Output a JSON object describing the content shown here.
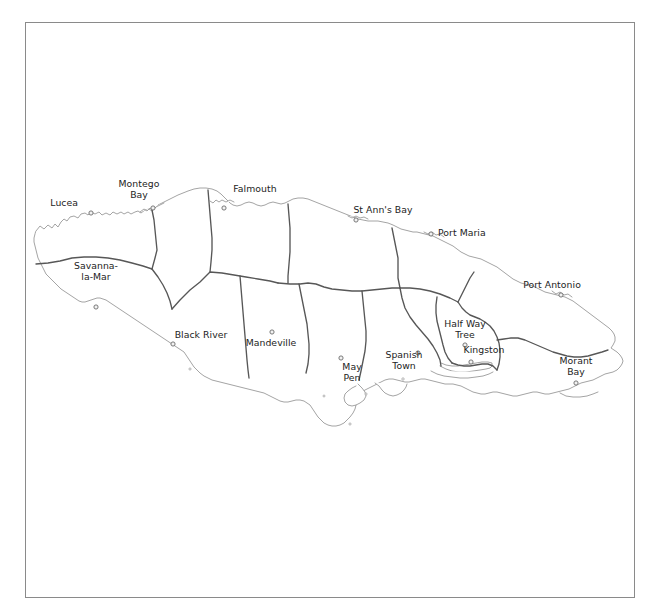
{
  "document": {
    "type": "map",
    "subject": "Jamaica parish map",
    "background_color": "#ffffff",
    "frame": {
      "name": "map-frame",
      "border_color": "#8a8a8a",
      "x": 25,
      "y": 22,
      "width": 610,
      "height": 576
    }
  },
  "map": {
    "coastline_color": "#8d8d8d",
    "parish_border_color": "#575757",
    "land_fill": "#ffffff",
    "label_color": "#232323",
    "marker_fill": "#f2f2f2",
    "marker_stroke": "#6b6b6b",
    "cities": [
      {
        "name": "Lucea",
        "label": "Lucea",
        "dot_x": 91,
        "dot_y": 213,
        "label_x": 78,
        "label_y": 198,
        "align": "r",
        "lines": [
          "Lucea"
        ]
      },
      {
        "name": "Montego Bay",
        "label": "Montego Bay",
        "dot_x": 153,
        "dot_y": 208,
        "label_x": 139,
        "label_y": 179,
        "align": "c",
        "lines": [
          "Montego",
          "Bay"
        ]
      },
      {
        "name": "Falmouth",
        "label": "Falmouth",
        "dot_x": 224,
        "dot_y": 208,
        "label_x": 255,
        "label_y": 184,
        "align": "c",
        "lines": [
          "Falmouth"
        ]
      },
      {
        "name": "St Ann's Bay",
        "label": "St Ann's Bay",
        "dot_x": 356,
        "dot_y": 220,
        "label_x": 383,
        "label_y": 205,
        "align": "c",
        "lines": [
          "St Ann's Bay"
        ]
      },
      {
        "name": "Port Maria",
        "label": "Port Maria",
        "dot_x": 431,
        "dot_y": 234,
        "label_x": 438,
        "label_y": 228,
        "align": "l",
        "lines": [
          "Port Maria"
        ]
      },
      {
        "name": "Port Antonio",
        "label": "Port Antonio",
        "dot_x": 561,
        "dot_y": 295,
        "label_x": 552,
        "label_y": 280,
        "align": "c",
        "lines": [
          "Port Antonio"
        ]
      },
      {
        "name": "Savanna-la-Mar",
        "label": "Savanna-la-Mar",
        "dot_x": 96,
        "dot_y": 307,
        "label_x": 96,
        "label_y": 261,
        "align": "c",
        "lines": [
          "Savanna-",
          "la-Mar"
        ]
      },
      {
        "name": "Black River",
        "label": "Black River",
        "dot_x": 173,
        "dot_y": 344,
        "label_x": 201,
        "label_y": 330,
        "align": "c",
        "lines": [
          "Black River"
        ]
      },
      {
        "name": "Mandeville",
        "label": "Mandeville",
        "dot_x": 272,
        "dot_y": 332,
        "label_x": 271,
        "label_y": 338,
        "align": "c",
        "lines": [
          "Mandeville"
        ]
      },
      {
        "name": "May Pen",
        "label": "May Pen",
        "dot_x": 341,
        "dot_y": 358,
        "label_x": 352,
        "label_y": 362,
        "align": "c",
        "lines": [
          "May",
          "Pen"
        ]
      },
      {
        "name": "Spanish Town",
        "label": "Spanish Town",
        "dot_x": 418,
        "dot_y": 353,
        "label_x": 404,
        "label_y": 350,
        "align": "c",
        "lines": [
          "Spanish",
          "Town"
        ]
      },
      {
        "name": "Half Way Tree",
        "label": "Half Way Tree",
        "dot_x": 465,
        "dot_y": 345,
        "label_x": 465,
        "label_y": 319,
        "align": "c",
        "lines": [
          "Half Way",
          "Tree"
        ]
      },
      {
        "name": "Kingston",
        "label": "Kingston",
        "dot_x": 471,
        "dot_y": 362,
        "label_x": 484,
        "label_y": 345,
        "align": "c",
        "lines": [
          "Kingston"
        ]
      },
      {
        "name": "Morant Bay",
        "label": "Morant Bay",
        "dot_x": 576,
        "dot_y": 383,
        "label_x": 576,
        "label_y": 356,
        "align": "c",
        "lines": [
          "Morant",
          "Bay"
        ]
      }
    ]
  }
}
